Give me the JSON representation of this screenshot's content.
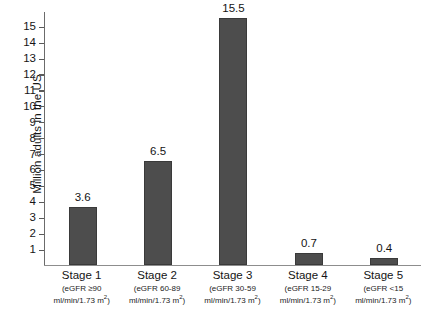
{
  "chart_data": {
    "type": "bar",
    "title": "",
    "xlabel": "",
    "ylabel": "Million adults in the US",
    "ylim": [
      0,
      15.9
    ],
    "grid": false,
    "legend": null,
    "categories": [
      "Stage 1",
      "Stage 2",
      "Stage 3",
      "Stage 4",
      "Stage 5"
    ],
    "values": [
      3.6,
      6.5,
      15.5,
      0.7,
      0.4
    ],
    "value_labels": [
      "3.6",
      "6.5",
      "15.5",
      "0.7",
      "0.4"
    ],
    "category_sublabels": [
      [
        "(eGFR ≥90",
        "ml/min/1.73 m",
        ")"
      ],
      [
        "(eGFR 60-89",
        "ml/min/1.73 m",
        ")"
      ],
      [
        "(eGFR 30-59",
        "ml/min/1.73 m",
        ")"
      ],
      [
        "(eGFR 15-29",
        "ml/min/1.73 m",
        ")"
      ],
      [
        "(eGFR <15",
        "ml/min/1.73 m",
        ")"
      ]
    ],
    "ytick_labels": [
      "15",
      "14",
      "13",
      "12",
      "11",
      "10",
      "9",
      "8",
      "7",
      "6",
      "5",
      "4",
      "3",
      "2",
      "1"
    ],
    "ytick_values": [
      15,
      14,
      13,
      12,
      11,
      10,
      9,
      8,
      7,
      6,
      5,
      4,
      3,
      2,
      1
    ],
    "bar_color": "#4d4d4d",
    "axis_color": "#6b6b6b",
    "text_color": "#141414",
    "background": "#ffffff"
  },
  "axis": {
    "y_title": "Million adults in the US"
  },
  "categories": [
    {
      "stage": "Stage 1",
      "sub1": "(eGFR ≥90",
      "sub2_pre": "ml/min/1.73 m",
      "sub2_sup": "2",
      "sub2_post": ")",
      "value_label": "3.6"
    },
    {
      "stage": "Stage 2",
      "sub1": "(eGFR 60-89",
      "sub2_pre": "ml/min/1.73 m",
      "sub2_sup": "2",
      "sub2_post": ")",
      "value_label": "6.5"
    },
    {
      "stage": "Stage 3",
      "sub1": "(eGFR 30-59",
      "sub2_pre": "ml/min/1.73 m",
      "sub2_sup": "2",
      "sub2_post": ")",
      "value_label": "15.5"
    },
    {
      "stage": "Stage 4",
      "sub1": "(eGFR 15-29",
      "sub2_pre": "ml/min/1.73 m",
      "sub2_sup": "2",
      "sub2_post": ")",
      "value_label": "0.7"
    },
    {
      "stage": "Stage 5",
      "sub1": "(eGFR <15",
      "sub2_pre": "ml/min/1.73 m",
      "sub2_sup": "2",
      "sub2_post": ")",
      "value_label": "0.4"
    }
  ],
  "yticks": [
    {
      "label": "15"
    },
    {
      "label": "14"
    },
    {
      "label": "13"
    },
    {
      "label": "12"
    },
    {
      "label": "11"
    },
    {
      "label": "10"
    },
    {
      "label": "9"
    },
    {
      "label": "8"
    },
    {
      "label": "7"
    },
    {
      "label": "6"
    },
    {
      "label": "5"
    },
    {
      "label": "4"
    },
    {
      "label": "3"
    },
    {
      "label": "2"
    },
    {
      "label": "1"
    }
  ]
}
